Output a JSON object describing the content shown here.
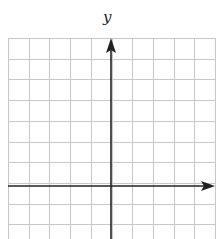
{
  "diagram": {
    "type": "coordinate-grid",
    "x_axis_label": "",
    "y_axis_label": "y",
    "grid": {
      "columns": 10,
      "rows": 10,
      "visible_rows": 9.5,
      "cell_size_px": 20.7,
      "origin_column": 5,
      "origin_row": 7
    },
    "colors": {
      "grid": "#c8c8c8",
      "axis": "#222222",
      "background": "#ffffff"
    }
  }
}
